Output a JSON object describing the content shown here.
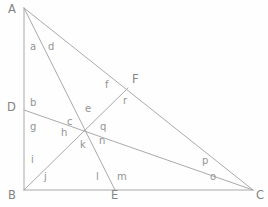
{
  "figure": {
    "type": "geometry-diagram",
    "background_color": "#fefefe",
    "line_color": "#a0a0a0",
    "label_color": "#8c8c8c",
    "width": 268,
    "height": 207,
    "top_partial_text": ""
  },
  "points": [
    {
      "id": "A",
      "label": "A",
      "x": 24,
      "y": 8,
      "label_x": 8,
      "label_y": 4
    },
    {
      "id": "B",
      "label": "B",
      "x": 24,
      "y": 190,
      "label_x": 8,
      "label_y": 190
    },
    {
      "id": "C",
      "label": "C",
      "x": 253,
      "y": 190,
      "label_x": 256,
      "label_y": 190
    },
    {
      "id": "D",
      "label": "D",
      "x": 24,
      "y": 110,
      "label_x": 7,
      "label_y": 102
    },
    {
      "id": "E",
      "label": "E",
      "x": 115,
      "y": 190,
      "label_x": 111,
      "label_y": 190
    },
    {
      "id": "F",
      "label": "F",
      "x": 128,
      "y": 88,
      "label_x": 132,
      "label_y": 74
    },
    {
      "id": "O",
      "label": "",
      "x": 86,
      "y": 132,
      "label_x": 0,
      "label_y": 0
    }
  ],
  "segments": [
    {
      "id": "AB",
      "from": "A",
      "to": "B"
    },
    {
      "id": "BC",
      "from": "B",
      "to": "C"
    },
    {
      "id": "AC",
      "from": "A",
      "to": "C"
    },
    {
      "id": "AE",
      "from": "A",
      "to": "E"
    },
    {
      "id": "DC",
      "from": "D",
      "to": "C"
    },
    {
      "id": "BF",
      "from": "B",
      "to": "F"
    }
  ],
  "angle_labels": [
    {
      "id": "a",
      "label": "a",
      "x": 30,
      "y": 42
    },
    {
      "id": "d",
      "label": "d",
      "x": 48,
      "y": 42
    },
    {
      "id": "f",
      "label": "f",
      "x": 105,
      "y": 80
    },
    {
      "id": "b",
      "label": "b",
      "x": 30,
      "y": 98
    },
    {
      "id": "e",
      "label": "e",
      "x": 85,
      "y": 104
    },
    {
      "id": "r",
      "label": "r",
      "x": 123,
      "y": 96
    },
    {
      "id": "g",
      "label": "g",
      "x": 30,
      "y": 122
    },
    {
      "id": "c",
      "label": "c",
      "x": 67,
      "y": 117
    },
    {
      "id": "h",
      "label": "h",
      "x": 61,
      "y": 128
    },
    {
      "id": "q",
      "label": "q",
      "x": 100,
      "y": 122
    },
    {
      "id": "k",
      "label": "k",
      "x": 80,
      "y": 140
    },
    {
      "id": "n",
      "label": "n",
      "x": 99,
      "y": 136
    },
    {
      "id": "i",
      "label": "i",
      "x": 31,
      "y": 155
    },
    {
      "id": "p",
      "label": "p",
      "x": 202,
      "y": 156
    },
    {
      "id": "j",
      "label": "j",
      "x": 44,
      "y": 172
    },
    {
      "id": "l",
      "label": "l",
      "x": 96,
      "y": 172
    },
    {
      "id": "m",
      "label": "m",
      "x": 117,
      "y": 172
    },
    {
      "id": "o",
      "label": "o",
      "x": 210,
      "y": 172
    }
  ]
}
